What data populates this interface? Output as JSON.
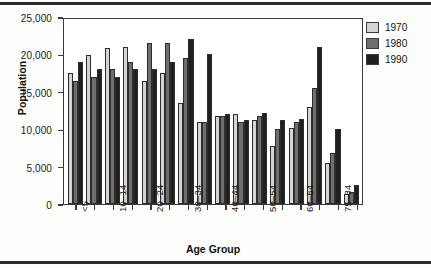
{
  "chart_data": {
    "type": "bar",
    "title": "",
    "xlabel": "Age Group",
    "ylabel": "Population",
    "ylim": [
      0,
      25000
    ],
    "yticks": [
      0,
      5000,
      10000,
      15000,
      20000,
      25000
    ],
    "ytick_labels": [
      "0",
      "5,000",
      "10,000",
      "15,000",
      "20,000",
      "25,000"
    ],
    "grid": false,
    "legend_position": "top-right",
    "categories": [
      "<5",
      "5–9",
      "10–14",
      "15–19",
      "20–24",
      "25–29",
      "30–34",
      "35–39",
      "40–44",
      "45–49",
      "50–54",
      "55–59",
      "60–64",
      "65–74",
      "75–84",
      "85+"
    ],
    "visible_tick_labels": [
      "<5",
      "10–14",
      "20–24",
      "30–34",
      "40–44",
      "50–54",
      "60–64",
      "75–84"
    ],
    "series": [
      {
        "name": "1970",
        "color": "#d6d4d0",
        "values": [
          17500,
          19900,
          20900,
          21000,
          16500,
          17500,
          13500,
          11000,
          11700,
          12000,
          11200,
          7800,
          10200,
          13000,
          5500,
          1300
        ]
      },
      {
        "name": "1980",
        "color": "#6e6e6c",
        "values": [
          16500,
          17000,
          18000,
          19000,
          21500,
          21500,
          19500,
          11000,
          11700,
          11000,
          11800,
          10000,
          11000,
          15500,
          6800,
          1600
        ]
      },
      {
        "name": "1990",
        "color": "#1f1f1f",
        "values": [
          19000,
          18000,
          17000,
          18000,
          18000,
          19000,
          22000,
          20000,
          12000,
          11200,
          12200,
          11200,
          11300,
          21000,
          10000,
          2500
        ]
      }
    ]
  },
  "legend": {
    "entries": [
      {
        "label": "1970",
        "color": "#d6d4d0"
      },
      {
        "label": "1980",
        "color": "#6e6e6c"
      },
      {
        "label": "1990",
        "color": "#1f1f1f"
      }
    ]
  }
}
